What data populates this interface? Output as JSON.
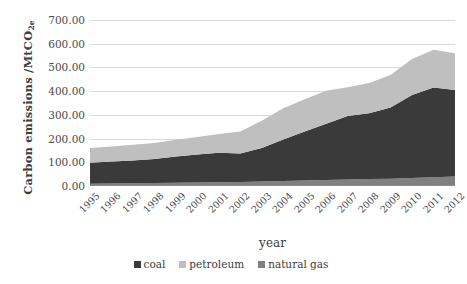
{
  "chart_data": {
    "type": "area",
    "title": "",
    "subtitle": "",
    "xlabel": "year",
    "ylabel": "Carbon emissions /MtCO2e",
    "ylabel_main": "Carbon emissions /MtCO",
    "ylabel_sub": "2e",
    "stacked": true,
    "grid": true,
    "legend_position": "bottom",
    "xlim": [
      1995,
      2012
    ],
    "ylim": [
      0,
      700
    ],
    "ytick_labels": [
      "700.00",
      "600.00",
      "500.00",
      "400.00",
      "300.00",
      "200.00",
      "100.00",
      "0.00"
    ],
    "ytick_values": [
      700,
      600,
      500,
      400,
      300,
      200,
      100,
      0
    ],
    "categories": [
      "1995",
      "1996",
      "1997",
      "1998",
      "1999",
      "2000",
      "2001",
      "2002",
      "2003",
      "2004",
      "2005",
      "2006",
      "2007",
      "2008",
      "2009",
      "2010",
      "2011",
      "2012"
    ],
    "series": [
      {
        "name": "natural gas",
        "color": "#808080",
        "values": [
          10,
          11,
          12,
          13,
          14,
          15,
          16,
          17,
          19,
          21,
          23,
          25,
          27,
          29,
          31,
          34,
          37,
          40
        ]
      },
      {
        "name": "coal",
        "color": "#3a3a3a",
        "values": [
          88,
          92,
          96,
          101,
          110,
          118,
          124,
          120,
          141,
          175,
          207,
          237,
          268,
          278,
          300,
          350,
          378,
          365
        ]
      },
      {
        "name": "petroleum",
        "color": "#bfbfbf",
        "values": [
          62,
          64,
          66,
          67,
          71,
          74,
          79,
          93,
          115,
          132,
          136,
          140,
          121,
          127,
          137,
          152,
          160,
          155
        ]
      }
    ],
    "totals": [
      160,
      167,
      174,
      181,
      195,
      207,
      219,
      230,
      275,
      328,
      366,
      402,
      416,
      434,
      468,
      536,
      575,
      560
    ],
    "legend": [
      {
        "label": "coal",
        "color": "#3a3a3a"
      },
      {
        "label": "petroleum",
        "color": "#bfbfbf"
      },
      {
        "label": "natural gas",
        "color": "#808080"
      }
    ]
  }
}
